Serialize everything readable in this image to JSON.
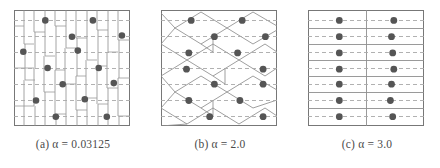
{
  "figure": {
    "panel_count": 3,
    "dot_color": "#555555",
    "line_color": "#8a8a8a",
    "border_color": "#777777",
    "background": "#ffffff"
  },
  "panels": [
    {
      "id": "a",
      "caption": "(a)  α = 0.03125",
      "label": "(a)",
      "alpha_text": "α = 0.03125",
      "alpha_value": 0.03125,
      "description": "irregular fine vertical strips with jagged horizontal breaks",
      "points": [
        [
          0.27,
          0.09
        ],
        [
          0.68,
          0.09
        ],
        [
          0.5,
          0.23
        ],
        [
          0.93,
          0.22
        ],
        [
          0.08,
          0.36
        ],
        [
          0.55,
          0.35
        ],
        [
          0.29,
          0.5
        ],
        [
          0.73,
          0.5
        ],
        [
          0.42,
          0.64
        ],
        [
          0.86,
          0.63
        ],
        [
          0.19,
          0.78
        ],
        [
          0.61,
          0.77
        ],
        [
          0.36,
          0.92
        ],
        [
          0.8,
          0.92
        ]
      ]
    },
    {
      "id": "b",
      "caption": "(b)  α = 2.0",
      "label": "(b)",
      "alpha_text": "α = 2.0",
      "alpha_value": 2.0,
      "description": "diamond / lens shaped cells in staggered rows",
      "points": [
        [
          0.26,
          0.09
        ],
        [
          0.7,
          0.09
        ],
        [
          0.46,
          0.23
        ],
        [
          0.9,
          0.23
        ],
        [
          0.24,
          0.37
        ],
        [
          0.66,
          0.37
        ],
        [
          0.22,
          0.51
        ],
        [
          0.88,
          0.51
        ],
        [
          0.46,
          0.64
        ],
        [
          0.88,
          0.64
        ],
        [
          0.24,
          0.78
        ],
        [
          0.68,
          0.78
        ],
        [
          0.42,
          0.92
        ],
        [
          0.88,
          0.92
        ]
      ]
    },
    {
      "id": "c",
      "caption": "(c)  α = 3.0",
      "label": "(c)",
      "alpha_text": "α = 3.0",
      "alpha_value": 3.0,
      "description": "horizontal bands split by a single vertical divider",
      "points": [
        [
          0.27,
          0.09
        ],
        [
          0.74,
          0.09
        ],
        [
          0.27,
          0.23
        ],
        [
          0.72,
          0.23
        ],
        [
          0.27,
          0.37
        ],
        [
          0.73,
          0.37
        ],
        [
          0.27,
          0.51
        ],
        [
          0.74,
          0.51
        ],
        [
          0.27,
          0.64
        ],
        [
          0.72,
          0.64
        ],
        [
          0.27,
          0.78
        ],
        [
          0.71,
          0.78
        ],
        [
          0.27,
          0.92
        ],
        [
          0.73,
          0.92
        ]
      ]
    }
  ]
}
